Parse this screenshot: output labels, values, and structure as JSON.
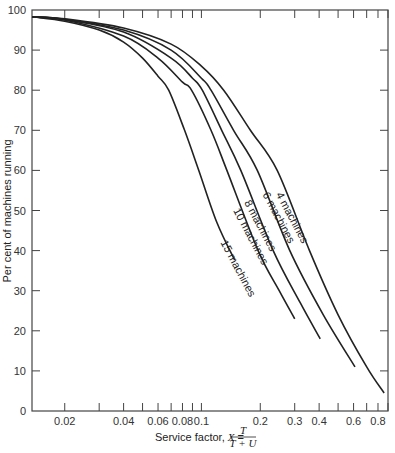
{
  "chart_data": {
    "type": "line",
    "title": "",
    "xlabel": "Service factor, X = T/(T+U)",
    "xlabel_prefix": "Service factor, ",
    "xlabel_var": "X",
    "xlabel_eq": "=",
    "xlabel_num": "T",
    "xlabel_den": "T + U",
    "ylabel": "Per cent of machines running",
    "xscale": "log",
    "xlim": [
      0.0136,
      0.9
    ],
    "ylim": [
      0,
      100
    ],
    "grid": false,
    "legend": "inline labels on curves",
    "x_ticks_major": [
      {
        "value": 0.02,
        "label": "0.02"
      },
      {
        "value": 0.04,
        "label": "0.04"
      },
      {
        "value": 0.06,
        "label": "0.06"
      },
      {
        "value": 0.08,
        "label": "0.08"
      },
      {
        "value": 0.1,
        "label": "0.1"
      },
      {
        "value": 0.2,
        "label": "0.2"
      },
      {
        "value": 0.3,
        "label": "0.3"
      },
      {
        "value": 0.4,
        "label": "0.4"
      },
      {
        "value": 0.6,
        "label": "0.6"
      },
      {
        "value": 0.8,
        "label": "0.8"
      }
    ],
    "x_ticks_minor": [
      0.03,
      0.05,
      0.07,
      0.09,
      0.5,
      0.7,
      0.9
    ],
    "y_ticks": [
      0,
      10,
      20,
      30,
      40,
      50,
      60,
      70,
      80,
      90,
      100
    ],
    "series": [
      {
        "name": "4 machines",
        "label": "4 machines",
        "x": [
          0.0136,
          0.02,
          0.04,
          0.07,
          0.1,
          0.13,
          0.178,
          0.244,
          0.357,
          0.5,
          0.7,
          0.86
        ],
        "y": [
          98.3,
          97.8,
          95.5,
          91.5,
          86,
          80,
          70,
          60,
          40,
          24,
          11,
          4.5
        ],
        "label_pos": {
          "x": 0.24,
          "y": 54,
          "angle": 62
        }
      },
      {
        "name": "6 machines",
        "label": "6 machines",
        "x": [
          0.0136,
          0.02,
          0.04,
          0.07,
          0.1,
          0.112,
          0.146,
          0.193,
          0.283,
          0.42,
          0.61
        ],
        "y": [
          98.3,
          97.7,
          95,
          90,
          83,
          80,
          70,
          60,
          40,
          24,
          11
        ],
        "label_pos": {
          "x": 0.205,
          "y": 54,
          "angle": 62
        }
      },
      {
        "name": "8 machines",
        "label": "8 machines",
        "x": [
          0.0136,
          0.02,
          0.04,
          0.07,
          0.09,
          0.101,
          0.127,
          0.159,
          0.233,
          0.32,
          0.405
        ],
        "y": [
          98.3,
          97.6,
          94.5,
          88,
          83,
          80,
          70,
          60,
          40,
          27,
          18
        ],
        "label_pos": {
          "x": 0.165,
          "y": 52,
          "angle": 62
        }
      },
      {
        "name": "10 machines",
        "label": "10 machines",
        "x": [
          0.0136,
          0.02,
          0.04,
          0.06,
          0.08,
          0.089,
          0.112,
          0.135,
          0.195,
          0.25,
          0.3
        ],
        "y": [
          98.3,
          97.5,
          93.5,
          88,
          82,
          80,
          70,
          60,
          40,
          30,
          23
        ],
        "label_pos": {
          "x": 0.145,
          "y": 50,
          "angle": 62
        }
      },
      {
        "name": "15 machines",
        "label": "15 machines",
        "x": [
          0.0136,
          0.02,
          0.03,
          0.04,
          0.05,
          0.06,
          0.068,
          0.082,
          0.097,
          0.12,
          0.148
        ],
        "y": [
          98.3,
          97.2,
          95,
          92,
          88,
          83.5,
          80,
          70,
          60,
          47,
          37.6
        ],
        "label_pos": {
          "x": 0.125,
          "y": 42,
          "angle": 62
        }
      }
    ]
  }
}
